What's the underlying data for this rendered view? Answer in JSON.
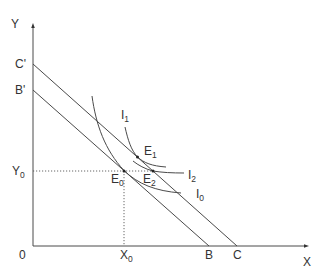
{
  "diagram": {
    "type": "budget-line-indifference-curve",
    "axes": {
      "x_label": "X",
      "y_label": "Y",
      "origin_label": "0"
    },
    "budget_lines": [
      {
        "name": "B'B",
        "y_intercept_label": "B'",
        "x_intercept_label": "B"
      },
      {
        "name": "C'C",
        "y_intercept_label": "C'",
        "x_intercept_label": "C"
      }
    ],
    "indifference_curves": [
      {
        "label": "I",
        "sub": "0"
      },
      {
        "label": "I",
        "sub": "1"
      },
      {
        "label": "I",
        "sub": "2"
      }
    ],
    "equilibrium_points": [
      {
        "label": "E",
        "sub": "0"
      },
      {
        "label": "E",
        "sub": "1"
      },
      {
        "label": "E",
        "sub": "2"
      }
    ],
    "guides": {
      "x0_label": "X",
      "x0_sub": "0",
      "y0_label": "Y",
      "y0_sub": "0"
    },
    "colors": {
      "line": "#4a4a4a",
      "background": "#ffffff"
    }
  }
}
